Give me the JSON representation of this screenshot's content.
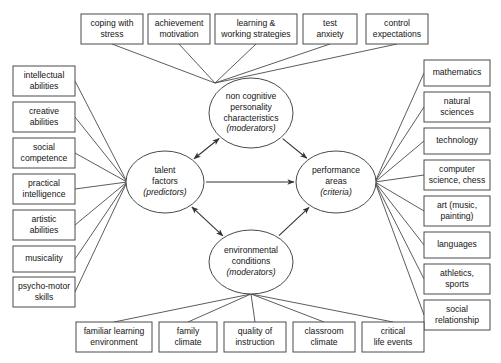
{
  "diagram": {
    "style": {
      "box_stroke": "#4a4a4a",
      "arrow_stroke": "#333333",
      "text_color": "#141414",
      "background": "#ffffff"
    },
    "ellipses": [
      {
        "id": "non-cognitive-personality-characteristics",
        "lines": [
          "non cognitive",
          "personality",
          "characteristics"
        ],
        "italic_line": "(moderators)",
        "cx": 251,
        "cy": 113,
        "rx": 42,
        "ry": 35
      },
      {
        "id": "talent-factors",
        "lines": [
          "talent",
          "factors"
        ],
        "italic_line": "(predictors)",
        "cx": 165,
        "cy": 182,
        "rx": 39,
        "ry": 31
      },
      {
        "id": "performance-areas",
        "lines": [
          "performance",
          "areas"
        ],
        "italic_line": "(criteria)",
        "cx": 336,
        "cy": 182,
        "rx": 40,
        "ry": 31
      },
      {
        "id": "environmental-conditions",
        "lines": [
          "environmental",
          "conditions"
        ],
        "italic_line": "(moderators)",
        "cx": 251,
        "cy": 262,
        "rx": 42,
        "ry": 32
      }
    ],
    "top_boxes": [
      {
        "id": "coping-with-stress",
        "lines": [
          "coping with",
          "stress"
        ],
        "x": 81,
        "y": 14,
        "w": 62,
        "h": 30
      },
      {
        "id": "achievement-motivation",
        "lines": [
          "achievement",
          "motivation"
        ],
        "x": 148,
        "y": 14,
        "w": 62,
        "h": 30
      },
      {
        "id": "learning-and-working-strategies",
        "lines": [
          "learning &",
          "working strategies"
        ],
        "x": 215,
        "y": 14,
        "w": 82,
        "h": 30
      },
      {
        "id": "test-anxiety",
        "lines": [
          "test",
          "anxiety"
        ],
        "x": 303,
        "y": 14,
        "w": 54,
        "h": 30
      },
      {
        "id": "control-expectations",
        "lines": [
          "control",
          "expectations"
        ],
        "x": 366,
        "y": 14,
        "w": 62,
        "h": 30
      }
    ],
    "left_boxes": [
      {
        "id": "intellectual-abilities",
        "lines": [
          "intellectual",
          "abilities"
        ],
        "x": 13,
        "y": 66,
        "w": 62,
        "h": 30
      },
      {
        "id": "creative-abilities",
        "lines": [
          "creative",
          "abilities"
        ],
        "x": 13,
        "y": 102,
        "w": 62,
        "h": 30
      },
      {
        "id": "social-competence",
        "lines": [
          "social",
          "competence"
        ],
        "x": 13,
        "y": 138,
        "w": 62,
        "h": 30
      },
      {
        "id": "practical-intelligence",
        "lines": [
          "practical",
          "intelligence"
        ],
        "x": 13,
        "y": 174,
        "w": 62,
        "h": 30
      },
      {
        "id": "artistic-abilities",
        "lines": [
          "artistic",
          "abilities"
        ],
        "x": 13,
        "y": 210,
        "w": 62,
        "h": 30
      },
      {
        "id": "musicality",
        "lines": [
          "musicality"
        ],
        "x": 13,
        "y": 246,
        "w": 62,
        "h": 26
      },
      {
        "id": "psycho-motor-skills",
        "lines": [
          "psycho-motor",
          "skills"
        ],
        "x": 13,
        "y": 277,
        "w": 62,
        "h": 30
      }
    ],
    "right_boxes": [
      {
        "id": "mathematics",
        "lines": [
          "mathematics"
        ],
        "x": 424,
        "y": 60,
        "w": 66,
        "h": 26
      },
      {
        "id": "natural-sciences",
        "lines": [
          "natural",
          "sciences"
        ],
        "x": 424,
        "y": 92,
        "w": 66,
        "h": 30
      },
      {
        "id": "technology",
        "lines": [
          "technology"
        ],
        "x": 424,
        "y": 128,
        "w": 66,
        "h": 26
      },
      {
        "id": "computer-science-chess",
        "lines": [
          "computer",
          "science, chess"
        ],
        "x": 424,
        "y": 160,
        "w": 66,
        "h": 30
      },
      {
        "id": "art-music-painting",
        "lines": [
          "art (music,",
          "painting)"
        ],
        "x": 424,
        "y": 196,
        "w": 66,
        "h": 30
      },
      {
        "id": "languages",
        "lines": [
          "languages"
        ],
        "x": 424,
        "y": 232,
        "w": 66,
        "h": 26
      },
      {
        "id": "athletics-sports",
        "lines": [
          "athletics,",
          "sports"
        ],
        "x": 424,
        "y": 264,
        "w": 66,
        "h": 30
      },
      {
        "id": "social-relationship",
        "lines": [
          "social",
          "relationship"
        ],
        "x": 424,
        "y": 300,
        "w": 66,
        "h": 30
      }
    ],
    "bottom_boxes": [
      {
        "id": "familiar-learning-environment",
        "lines": [
          "familiar learning",
          "environment"
        ],
        "x": 76,
        "y": 322,
        "w": 76,
        "h": 30
      },
      {
        "id": "family-climate",
        "lines": [
          "family",
          "climate"
        ],
        "x": 159,
        "y": 322,
        "w": 58,
        "h": 30
      },
      {
        "id": "quality-of-instruction",
        "lines": [
          "quality of",
          "instruction"
        ],
        "x": 224,
        "y": 322,
        "w": 62,
        "h": 30
      },
      {
        "id": "classroom-climate",
        "lines": [
          "classroom",
          "climate"
        ],
        "x": 293,
        "y": 322,
        "w": 62,
        "h": 30
      },
      {
        "id": "critical-life-events",
        "lines": [
          "critical",
          "life events"
        ],
        "x": 362,
        "y": 322,
        "w": 62,
        "h": 30
      }
    ],
    "hubs": {
      "top_hub": {
        "x": 215,
        "y": 83
      },
      "left_hub": {
        "x": 127,
        "y": 182
      },
      "right_hub": {
        "x": 375,
        "y": 182
      },
      "bottom_hub": {
        "x": 251,
        "y": 294
      }
    },
    "relations": [
      {
        "id": "talent-to-non-cognitive",
        "type": "double-arrow",
        "from": "talent-factors",
        "to": "non-cognitive-personality-characteristics"
      },
      {
        "id": "talent-to-environmental",
        "type": "double-arrow",
        "from": "talent-factors",
        "to": "environmental-conditions"
      },
      {
        "id": "talent-to-performance",
        "type": "arrow",
        "from": "talent-factors",
        "to": "performance-areas"
      },
      {
        "id": "non-cognitive-to-performance",
        "type": "arrow",
        "from": "non-cognitive-personality-characteristics",
        "to": "performance-areas"
      },
      {
        "id": "environmental-to-performance",
        "type": "arrow",
        "from": "environmental-conditions",
        "to": "performance-areas"
      }
    ]
  }
}
